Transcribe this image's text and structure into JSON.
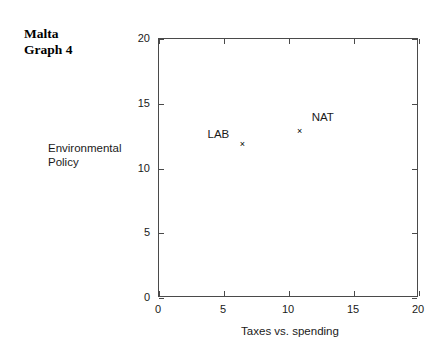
{
  "title": {
    "line1": "Malta",
    "line2": "Graph 4"
  },
  "chart_data": {
    "type": "scatter",
    "title": "Malta Graph 4",
    "xlabel": "Taxes vs. spending",
    "ylabel": "Environmental Policy",
    "ylabel_line1": "Environmental",
    "ylabel_line2": "Policy",
    "xlim": [
      0,
      20
    ],
    "ylim": [
      0,
      20
    ],
    "xticks": [
      0,
      5,
      10,
      15,
      20
    ],
    "yticks": [
      0,
      5,
      10,
      15,
      20
    ],
    "xtick_labels": [
      "0",
      "5",
      "10",
      "15",
      "20"
    ],
    "ytick_labels": [
      "0",
      "5",
      "10",
      "15",
      "20"
    ],
    "grid": false,
    "legend": "none",
    "marker_glyph": "×",
    "marker_color": "#000000",
    "frame_color": "#4a4a4a",
    "points": [
      {
        "name": "LAB",
        "x": 6.5,
        "y": 11.85,
        "label_position": "left"
      },
      {
        "name": "NAT",
        "x": 10.9,
        "y": 12.8,
        "label_position": "upper-right"
      }
    ]
  }
}
